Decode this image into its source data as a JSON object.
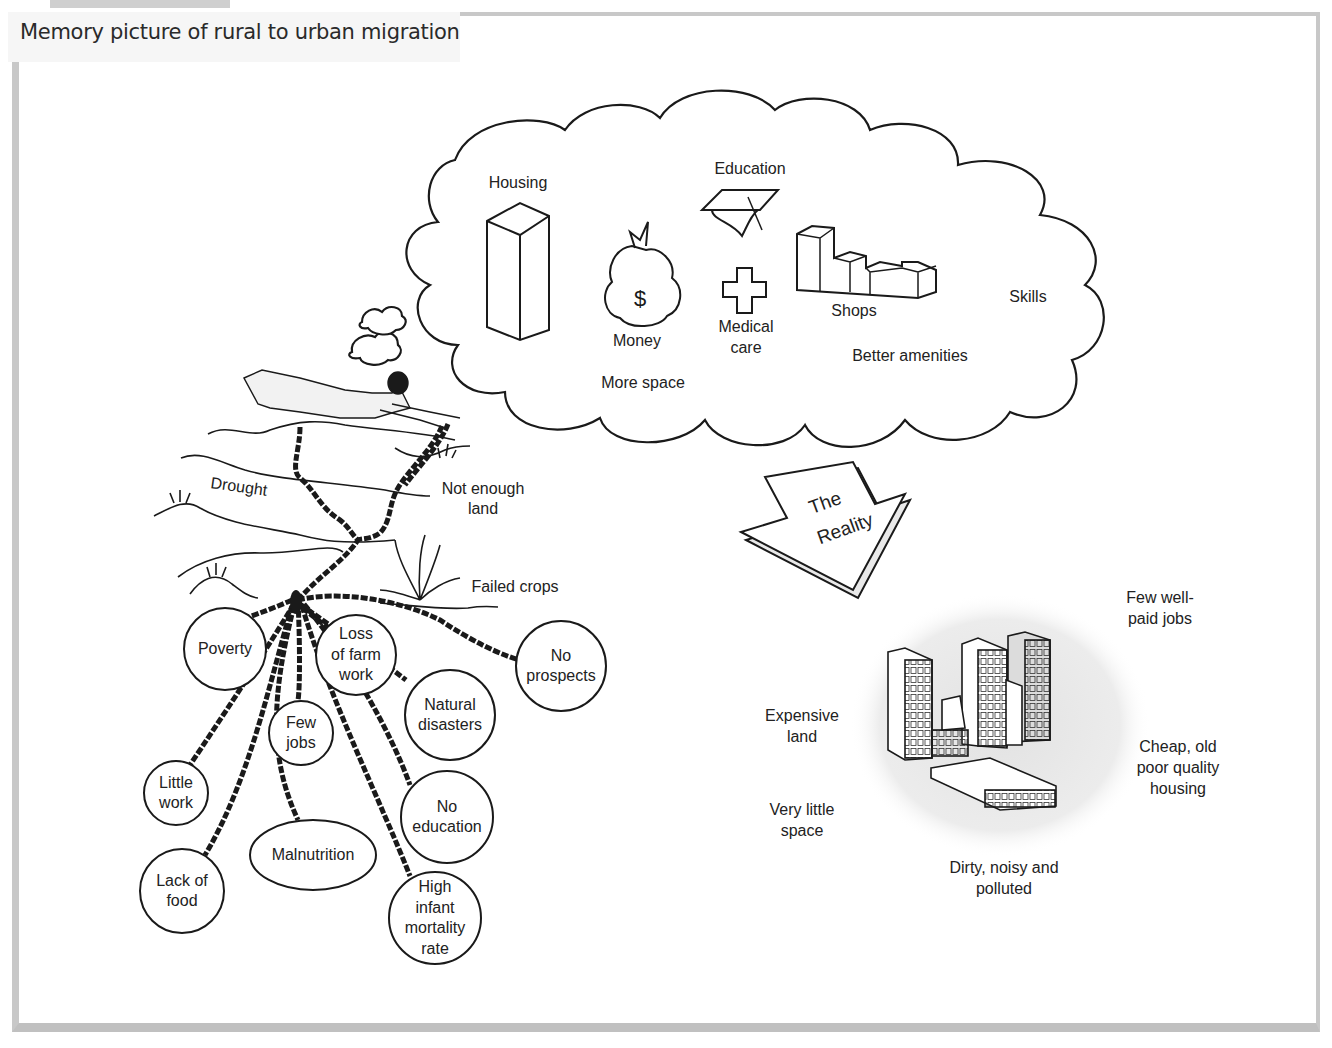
{
  "title": "Memory picture of rural to urban migration",
  "dream_cloud": {
    "items": [
      {
        "id": "housing",
        "label": "Housing",
        "icon": "tall-building-icon"
      },
      {
        "id": "education",
        "label": "Education",
        "icon": "graduation-cap-icon"
      },
      {
        "id": "money",
        "label": "Money",
        "icon": "money-bag-icon"
      },
      {
        "id": "medical",
        "label": "Medical\ncare",
        "icon": "medical-cross-icon"
      },
      {
        "id": "shops",
        "label": "Shops",
        "icon": "shops-blocks-icon"
      },
      {
        "id": "skills",
        "label": "Skills"
      },
      {
        "id": "amenities",
        "label": "Better amenities"
      },
      {
        "id": "space",
        "label": "More space"
      }
    ]
  },
  "rural_landscape": {
    "labels": {
      "drought": "Drought",
      "not_enough_land": "Not enough\nland",
      "failed_crops": "Failed crops"
    }
  },
  "push_factors": [
    {
      "id": "poverty",
      "label": "Poverty"
    },
    {
      "id": "loss-farm-work",
      "label": "Loss\nof farm\nwork"
    },
    {
      "id": "no-prospects",
      "label": "No\nprospects"
    },
    {
      "id": "few-jobs",
      "label": "Few\njobs"
    },
    {
      "id": "natural-disasters",
      "label": "Natural\ndisasters"
    },
    {
      "id": "little-work",
      "label": "Little\nwork"
    },
    {
      "id": "no-education",
      "label": "No\neducation"
    },
    {
      "id": "malnutrition",
      "label": "Malnutrition"
    },
    {
      "id": "lack-of-food",
      "label": "Lack of\nfood"
    },
    {
      "id": "infant-mortality",
      "label": "High\ninfant\nmortality\nrate"
    }
  ],
  "reality_arrow": {
    "label_line1": "The",
    "label_line2": "Reality"
  },
  "reality": {
    "labels": {
      "few_jobs": "Few well-\npaid jobs",
      "expensive_land": "Expensive\nland",
      "cheap_housing": "Cheap, old\npoor quality\nhousing",
      "little_space": "Very little\nspace",
      "dirty": "Dirty, noisy and\npolluted"
    }
  },
  "colors": {
    "frame": "#c8c8c8",
    "line": "#1a1a1a",
    "city_haze": "#e6e6e6",
    "title_bg": "#f6f6f6"
  }
}
